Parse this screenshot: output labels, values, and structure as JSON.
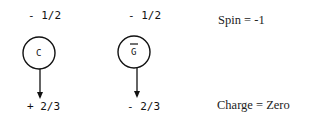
{
  "diagram": {
    "particles": [
      {
        "label": "C",
        "overbar": false,
        "spin": "- 1/2",
        "charge": "+ 2/3"
      },
      {
        "label": "G",
        "overbar": true,
        "spin": "- 1/2",
        "charge": "- 2/3"
      }
    ],
    "annotations": {
      "spin": "Spin = -1",
      "charge": "Charge = Zero"
    }
  }
}
